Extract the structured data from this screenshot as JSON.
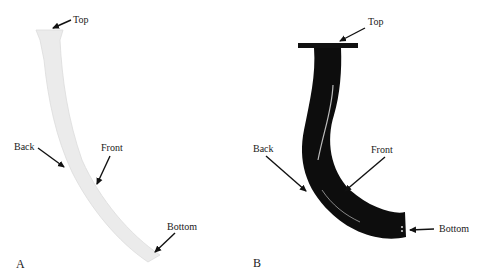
{
  "figure": {
    "panel_a": {
      "letter": "A",
      "labels": {
        "top": "Top",
        "back": "Back",
        "front": "Front",
        "bottom": "Bottom"
      },
      "shape_fill": "#ebebeb"
    },
    "panel_b": {
      "letter": "B",
      "labels": {
        "top": "Top",
        "back": "Back",
        "front": "Front",
        "bottom": "Bottom"
      },
      "shape_fill": "#0d0d0d"
    }
  }
}
